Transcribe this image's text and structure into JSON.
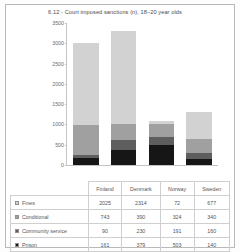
{
  "chart_data": {
    "type": "bar",
    "title": "6.12 - Court imposed sanctions (n), 18–20 year olds",
    "xlabel": "",
    "ylabel": "",
    "ylim": [
      0,
      3500
    ],
    "ytick_labels": [
      "3500",
      "3000",
      "2500",
      "2000",
      "1500",
      "1000",
      "500",
      "0"
    ],
    "ytick_values": [
      3500,
      3000,
      2500,
      2000,
      1500,
      1000,
      500,
      0
    ],
    "grid": false,
    "legend_position": "table-below",
    "stacked": true,
    "stack_order_bottom_to_top": [
      "Prison",
      "Community service",
      "Conditional",
      "Fines"
    ],
    "categories": [
      "Finland",
      "Denmark",
      "Norway",
      "Sweden"
    ],
    "series": [
      {
        "name": "Fines",
        "color": "#d2d2d2",
        "values": [
          2025,
          2314,
          72,
          677
        ]
      },
      {
        "name": "Conditional",
        "color": "#a0a0a0",
        "values": [
          743,
          390,
          324,
          340
        ]
      },
      {
        "name": "Community service",
        "color": "#5e5e5e",
        "values": [
          90,
          230,
          191,
          160
        ]
      },
      {
        "name": "Prison",
        "color": "#161616",
        "values": [
          161,
          379,
          503,
          140
        ]
      }
    ],
    "totals": [
      3019,
      3313,
      1090,
      1317
    ]
  },
  "table": {
    "columns": [
      "",
      "Finland",
      "Denmark",
      "Norway",
      "Sweden"
    ],
    "rows": [
      {
        "label": "Fines",
        "cells": [
          "2025",
          "2314",
          "72",
          "677"
        ]
      },
      {
        "label": "Conditional",
        "cells": [
          "743",
          "390",
          "324",
          "340"
        ]
      },
      {
        "label": "Community service",
        "cells": [
          "90",
          "230",
          "191",
          "160"
        ]
      },
      {
        "label": "Prison",
        "cells": [
          "161",
          "379",
          "503",
          "140"
        ]
      }
    ]
  }
}
